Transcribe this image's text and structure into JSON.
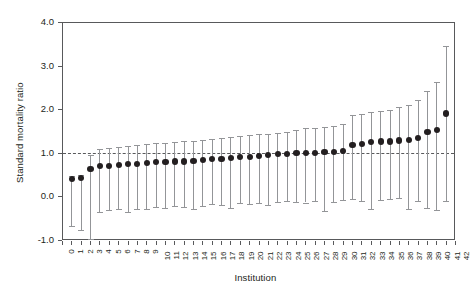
{
  "chart_data": {
    "type": "scatter",
    "title": "",
    "xlabel": "Institution",
    "ylabel": "Standard mortality ratio",
    "xlim": [
      0,
      42
    ],
    "ylim": [
      -1.0,
      4.0
    ],
    "yticks": [
      "-1.0",
      "0.0",
      "1.0",
      "2.0",
      "3.0",
      "4.0"
    ],
    "ytick_values": [
      -1.0,
      0.0,
      1.0,
      2.0,
      3.0,
      4.0
    ],
    "xticks": [
      "0",
      "1",
      "2",
      "3",
      "4",
      "5",
      "6",
      "7",
      "8",
      "9",
      "10",
      "11",
      "12",
      "13",
      "14",
      "15",
      "16",
      "17",
      "18",
      "19",
      "20",
      "21",
      "22",
      "23",
      "24",
      "25",
      "26",
      "27",
      "28",
      "29",
      "30",
      "31",
      "32",
      "33",
      "34",
      "35",
      "36",
      "37",
      "38",
      "39",
      "40",
      "41",
      "42"
    ],
    "grid": false,
    "legend": "none",
    "reference_line": {
      "y": 1.0,
      "style": "dashed",
      "color": "#58595b"
    },
    "point_color": "#231f20",
    "errorbar_color": "#939598",
    "series_name": "Standard mortality ratio with 95% CI",
    "categories": [
      1,
      2,
      3,
      4,
      5,
      6,
      7,
      8,
      9,
      10,
      11,
      12,
      13,
      14,
      15,
      16,
      17,
      18,
      19,
      20,
      21,
      22,
      23,
      24,
      25,
      26,
      27,
      28,
      29,
      30,
      31,
      32,
      33,
      34,
      35,
      36,
      37,
      38,
      39,
      40,
      41
    ],
    "values": [
      0.4,
      0.42,
      0.62,
      0.7,
      0.7,
      0.72,
      0.74,
      0.75,
      0.76,
      0.78,
      0.78,
      0.8,
      0.8,
      0.82,
      0.84,
      0.85,
      0.86,
      0.88,
      0.9,
      0.9,
      0.92,
      0.95,
      0.97,
      0.98,
      1.0,
      1.0,
      1.0,
      1.01,
      1.02,
      1.04,
      1.18,
      1.2,
      1.24,
      1.26,
      1.26,
      1.28,
      1.3,
      1.34,
      1.48,
      1.52,
      1.9
    ],
    "ci_lower": [
      -0.68,
      -0.78,
      -0.98,
      -0.36,
      -0.32,
      -0.3,
      -0.36,
      -0.28,
      -0.3,
      -0.24,
      -0.26,
      -0.22,
      -0.24,
      -0.28,
      -0.22,
      -0.18,
      -0.2,
      -0.26,
      -0.16,
      -0.18,
      -0.14,
      -0.2,
      -0.12,
      -0.1,
      -0.12,
      -0.14,
      -0.1,
      -0.34,
      -0.12,
      -0.08,
      -0.06,
      -0.1,
      -0.3,
      -0.08,
      -0.06,
      -0.04,
      -0.3,
      -0.1,
      -0.26,
      -0.32,
      -0.1
    ],
    "ci_upper": [
      0.46,
      0.48,
      0.96,
      1.08,
      1.12,
      1.14,
      1.16,
      1.18,
      1.2,
      1.22,
      1.22,
      1.24,
      1.26,
      1.28,
      1.3,
      1.32,
      1.34,
      1.36,
      1.38,
      1.4,
      1.42,
      1.44,
      1.46,
      1.48,
      1.52,
      1.56,
      1.58,
      1.6,
      1.62,
      1.66,
      1.86,
      1.9,
      1.94,
      1.96,
      1.98,
      2.04,
      2.1,
      2.22,
      2.42,
      2.62,
      3.46
    ]
  }
}
